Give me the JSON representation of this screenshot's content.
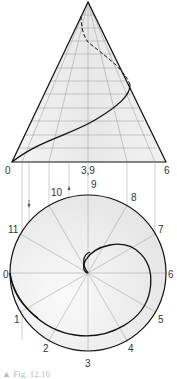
{
  "figure": {
    "caption": "▲ Fig. 12.16",
    "elevation": {
      "base_labels": [
        {
          "text": "0",
          "x": 5,
          "y": 174
        },
        {
          "text": "3,9",
          "x": 81,
          "y": 174
        },
        {
          "text": "6",
          "x": 164,
          "y": 174
        }
      ]
    },
    "plan": {
      "division_labels": [
        {
          "text": "0",
          "x": 3,
          "y": 278
        },
        {
          "text": "1",
          "x": 14,
          "y": 323
        },
        {
          "text": "2",
          "x": 43,
          "y": 352
        },
        {
          "text": "3",
          "x": 85,
          "y": 367
        },
        {
          "text": "4",
          "x": 128,
          "y": 352
        },
        {
          "text": "5",
          "x": 158,
          "y": 323
        },
        {
          "text": "6",
          "x": 168,
          "y": 278
        },
        {
          "text": "7",
          "x": 158,
          "y": 233
        },
        {
          "text": "8",
          "x": 131,
          "y": 201
        },
        {
          "text": "9",
          "x": 91,
          "y": 188
        },
        {
          "text": "10",
          "x": 51,
          "y": 196
        },
        {
          "text": "11",
          "x": 8,
          "y": 233
        }
      ]
    },
    "colors": {
      "fill": "#ececec",
      "line": "#111111",
      "construction": "#888888"
    }
  }
}
